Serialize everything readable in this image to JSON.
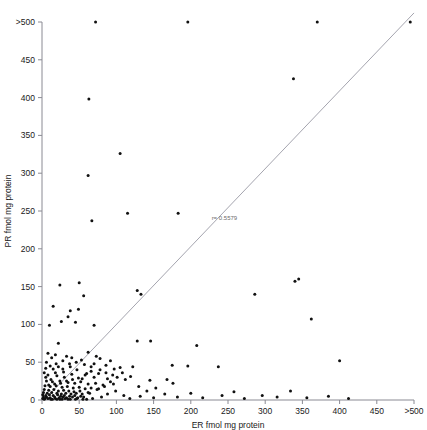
{
  "chart_data": {
    "type": "scatter",
    "title": "",
    "subtitle": "",
    "xlabel": "ER fmol mg protein",
    "ylabel": "PR fmol mg protein",
    "xlim": [
      0,
      500
    ],
    "ylim": [
      0,
      500
    ],
    "grid": false,
    "legend": "none",
    "x_ticks": [
      0,
      50,
      100,
      150,
      200,
      250,
      300,
      350,
      400,
      450,
      500
    ],
    "x_tick_labels": [
      "0",
      "50",
      "100",
      "150",
      "200",
      "250",
      "300",
      "350",
      "400",
      "450",
      ">500"
    ],
    "y_ticks": [
      0,
      50,
      100,
      150,
      200,
      250,
      300,
      350,
      400,
      450,
      500
    ],
    "y_tick_labels": [
      "0",
      "50",
      "100",
      "150",
      "200",
      "250",
      "300",
      "350",
      "400",
      "450",
      ">500"
    ],
    "annotations": [
      {
        "name": "correlation-annotation",
        "text": "r= 0.5579",
        "x": 228,
        "y": 238
      }
    ],
    "reference_line": {
      "name": "identity-line",
      "label": "",
      "x0": 3,
      "y0": 0,
      "x1": 500,
      "y1": 512,
      "color": "#9a9aa5"
    },
    "marker": {
      "shape": "dot",
      "size": 1.5,
      "color": "#111111"
    },
    "points": [
      [
        72,
        500
      ],
      [
        196,
        500
      ],
      [
        370,
        500
      ],
      [
        495,
        500
      ],
      [
        338,
        425
      ],
      [
        63,
        398
      ],
      [
        183,
        247
      ],
      [
        105,
        326
      ],
      [
        62,
        297
      ],
      [
        67,
        237
      ],
      [
        115,
        247
      ],
      [
        24,
        152
      ],
      [
        50,
        155
      ],
      [
        340,
        157
      ],
      [
        345,
        160
      ],
      [
        56,
        138
      ],
      [
        286,
        140
      ],
      [
        128,
        145
      ],
      [
        133,
        140
      ],
      [
        15,
        124
      ],
      [
        38,
        118
      ],
      [
        49,
        120
      ],
      [
        35,
        110
      ],
      [
        26,
        104
      ],
      [
        45,
        103
      ],
      [
        362,
        107
      ],
      [
        10,
        99
      ],
      [
        70,
        99
      ],
      [
        22,
        75
      ],
      [
        128,
        78
      ],
      [
        146,
        78
      ],
      [
        208,
        72
      ],
      [
        400,
        52
      ],
      [
        8,
        62
      ],
      [
        18,
        60
      ],
      [
        62,
        63
      ],
      [
        33,
        58
      ],
      [
        40,
        56
      ],
      [
        78,
        55
      ],
      [
        92,
        52
      ],
      [
        70,
        48
      ],
      [
        57,
        47
      ],
      [
        86,
        46
      ],
      [
        66,
        44
      ],
      [
        105,
        43
      ],
      [
        122,
        44
      ],
      [
        175,
        46
      ],
      [
        196,
        45
      ],
      [
        237,
        44
      ],
      [
        5,
        42
      ],
      [
        28,
        41
      ],
      [
        47,
        40
      ],
      [
        78,
        40
      ],
      [
        18,
        36
      ],
      [
        40,
        34
      ],
      [
        60,
        35
      ],
      [
        95,
        33
      ],
      [
        30,
        30
      ],
      [
        54,
        28
      ],
      [
        70,
        30
      ],
      [
        88,
        28
      ],
      [
        112,
        27
      ],
      [
        145,
        26
      ],
      [
        168,
        27
      ],
      [
        6,
        25
      ],
      [
        14,
        24
      ],
      [
        24,
        25
      ],
      [
        35,
        23
      ],
      [
        44,
        22
      ],
      [
        52,
        24
      ],
      [
        62,
        21
      ],
      [
        72,
        22
      ],
      [
        82,
        20
      ],
      [
        96,
        21
      ],
      [
        4,
        19
      ],
      [
        11,
        18
      ],
      [
        19,
        19
      ],
      [
        27,
        17
      ],
      [
        34,
        18
      ],
      [
        42,
        16
      ],
      [
        50,
        17
      ],
      [
        58,
        15
      ],
      [
        66,
        16
      ],
      [
        76,
        15
      ],
      [
        3,
        14
      ],
      [
        9,
        13
      ],
      [
        16,
        14
      ],
      [
        22,
        12
      ],
      [
        29,
        13
      ],
      [
        36,
        12
      ],
      [
        43,
        11
      ],
      [
        51,
        12
      ],
      [
        2,
        10
      ],
      [
        7,
        9
      ],
      [
        13,
        10
      ],
      [
        20,
        9
      ],
      [
        26,
        8
      ],
      [
        32,
        9
      ],
      [
        39,
        8
      ],
      [
        46,
        9
      ],
      [
        54,
        8
      ],
      [
        64,
        9
      ],
      [
        1,
        7
      ],
      [
        5,
        6
      ],
      [
        10,
        7
      ],
      [
        15,
        6
      ],
      [
        21,
        7
      ],
      [
        25,
        5
      ],
      [
        30,
        6
      ],
      [
        37,
        5
      ],
      [
        44,
        6
      ],
      [
        52,
        5
      ],
      [
        2,
        4
      ],
      [
        6,
        4
      ],
      [
        11,
        3
      ],
      [
        17,
        4
      ],
      [
        23,
        3
      ],
      [
        28,
        4
      ],
      [
        33,
        3
      ],
      [
        41,
        4
      ],
      [
        48,
        3
      ],
      [
        56,
        4
      ],
      [
        1,
        2
      ],
      [
        4,
        2
      ],
      [
        8,
        2
      ],
      [
        12,
        1
      ],
      [
        18,
        2
      ],
      [
        24,
        1
      ],
      [
        31,
        2
      ],
      [
        38,
        1
      ],
      [
        47,
        2
      ],
      [
        60,
        1
      ],
      [
        3,
        1
      ],
      [
        14,
        1
      ],
      [
        20,
        1
      ],
      [
        27,
        1
      ],
      [
        35,
        1
      ],
      [
        45,
        1
      ],
      [
        55,
        1
      ],
      [
        68,
        2
      ],
      [
        80,
        4
      ],
      [
        88,
        8
      ],
      [
        99,
        12
      ],
      [
        110,
        6
      ],
      [
        118,
        2
      ],
      [
        132,
        5
      ],
      [
        150,
        3
      ],
      [
        165,
        8
      ],
      [
        182,
        4
      ],
      [
        200,
        9
      ],
      [
        216,
        3
      ],
      [
        242,
        6
      ],
      [
        258,
        11
      ],
      [
        272,
        2
      ],
      [
        296,
        6
      ],
      [
        316,
        4
      ],
      [
        334,
        12
      ],
      [
        356,
        3
      ],
      [
        385,
        5
      ],
      [
        412,
        2
      ],
      [
        62,
        10
      ],
      [
        74,
        14
      ],
      [
        84,
        18
      ],
      [
        92,
        24
      ],
      [
        101,
        30
      ],
      [
        76,
        35
      ],
      [
        66,
        38
      ],
      [
        58,
        33
      ],
      [
        49,
        29
      ],
      [
        41,
        27
      ],
      [
        33,
        25
      ],
      [
        25,
        22
      ],
      [
        17,
        21
      ],
      [
        9,
        20
      ],
      [
        12,
        27
      ],
      [
        20,
        32
      ],
      [
        29,
        37
      ],
      [
        38,
        44
      ],
      [
        46,
        50
      ],
      [
        28,
        52
      ],
      [
        19,
        48
      ],
      [
        11,
        45
      ],
      [
        6,
        50
      ],
      [
        13,
        56
      ],
      [
        8,
        33
      ],
      [
        15,
        41
      ],
      [
        5,
        30
      ],
      [
        3,
        36
      ],
      [
        22,
        44
      ],
      [
        37,
        48
      ],
      [
        53,
        53
      ],
      [
        73,
        58
      ],
      [
        86,
        36
      ],
      [
        97,
        41
      ],
      [
        108,
        36
      ],
      [
        119,
        31
      ],
      [
        130,
        18
      ],
      [
        141,
        12
      ],
      [
        153,
        16
      ],
      [
        176,
        22
      ]
    ]
  }
}
